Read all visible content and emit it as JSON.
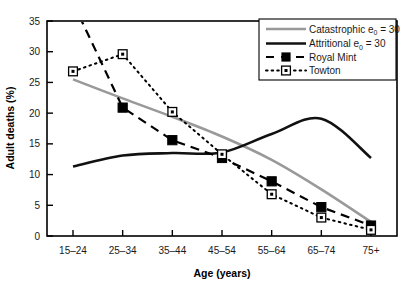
{
  "chart_data": {
    "type": "line",
    "title": "",
    "xlabel": "Age (years)",
    "ylabel": "Adult deaths (%)",
    "categories": [
      "15–24",
      "25–34",
      "35–44",
      "45–54",
      "55–64",
      "65–74",
      "75+"
    ],
    "ylim": [
      0,
      35
    ],
    "yticks": [
      0,
      5,
      10,
      15,
      20,
      25,
      30,
      35
    ],
    "ytick_labels": [
      "0",
      "5",
      "10",
      "15",
      "20",
      "25",
      "30",
      "35"
    ],
    "grid": false,
    "legend_position": "top-right",
    "series": [
      {
        "name": "Catastrophic e0 = 30",
        "legend_label": "Catastrophic e",
        "legend_sub": "0",
        "legend_tail": " = 30",
        "style": "solid",
        "color": "#999999",
        "width": 2.6,
        "marker": "none",
        "values": [
          25.5,
          22.4,
          19.4,
          16.2,
          12.4,
          7.6,
          2.3
        ]
      },
      {
        "name": "Attritional e0 = 30",
        "legend_label": "Attritional e",
        "legend_sub": "0",
        "legend_tail": " = 30",
        "style": "solid",
        "color": "#111111",
        "width": 2.6,
        "marker": "none",
        "values": [
          11.3,
          13.1,
          13.5,
          13.6,
          16.6,
          19.1,
          12.7
        ]
      },
      {
        "name": "Royal Mint",
        "legend_label": "Royal Mint",
        "style": "dashed",
        "color": "#000000",
        "width": 2.2,
        "marker": "filled-square",
        "values": [
          38.0,
          20.9,
          15.6,
          12.7,
          8.9,
          4.7,
          1.7
        ]
      },
      {
        "name": "Towton",
        "legend_label": "Towton",
        "style": "dotted",
        "color": "#000000",
        "width": 2.0,
        "marker": "open-square-dot",
        "values": [
          26.8,
          29.6,
          20.2,
          13.3,
          6.8,
          3.0,
          1.0
        ]
      }
    ],
    "annotations": []
  },
  "axes": {
    "y_axis_label": "Adult deaths (%)",
    "x_axis_label": "Age (years)"
  },
  "legend": {
    "entries": [
      {
        "label": "Catastrophic e",
        "sub": "0",
        "tail": " = 30"
      },
      {
        "label": "Attritional e",
        "sub": "0",
        "tail": " = 30"
      },
      {
        "label": "Royal Mint",
        "sub": "",
        "tail": ""
      },
      {
        "label": "Towton",
        "sub": "",
        "tail": ""
      }
    ]
  }
}
